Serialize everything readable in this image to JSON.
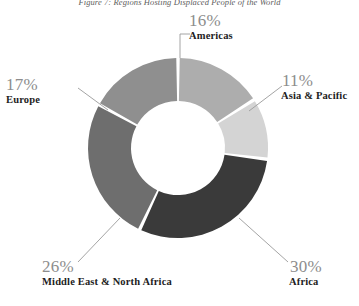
{
  "figure": {
    "title": "Figure 7: Regions Hosting Displaced People of the World"
  },
  "chart_data": {
    "type": "pie",
    "variant": "donut",
    "title": "Figure 7: Regions Hosting Displaced People of the World",
    "value_unit": "percent",
    "value_total": 100,
    "legend": "none (direct labels with leader lines)",
    "grid": false,
    "center": {
      "x": 178,
      "y": 148
    },
    "outer_radius": 90,
    "inner_radius": 43,
    "gap_degrees": 2.2,
    "start_angle_degrees": 0,
    "direction": "clockwise",
    "categories": [
      "Americas",
      "Asia & Pacific",
      "Africa",
      "Middle East & North Africa",
      "Europe"
    ],
    "values": [
      16,
      11,
      30,
      26,
      17
    ],
    "slices": [
      {
        "label": "Americas",
        "value": 16,
        "display_value": "16%",
        "color": "#adadad",
        "start_angle": 0,
        "end_angle": 57.6,
        "label_side": "top"
      },
      {
        "label": "Asia & Pacific",
        "value": 11,
        "display_value": "11%",
        "color": "#d4d4d4",
        "start_angle": 57.6,
        "end_angle": 97.2,
        "label_side": "right"
      },
      {
        "label": "Africa",
        "value": 30,
        "display_value": "30%",
        "color": "#3a3a3a",
        "start_angle": 97.2,
        "end_angle": 205.2,
        "label_side": "bottom-right"
      },
      {
        "label": "Middle East & North Africa",
        "value": 26,
        "display_value": "26%",
        "color": "#6e6e6e",
        "start_angle": 205.2,
        "end_angle": 298.8,
        "label_side": "bottom-left"
      },
      {
        "label": "Europe",
        "value": 17,
        "display_value": "17%",
        "color": "#8f8f8f",
        "start_angle": 298.8,
        "end_angle": 360,
        "label_side": "left"
      }
    ]
  },
  "callouts": {
    "americas": {
      "pct": "16%",
      "cat": "Americas"
    },
    "asia": {
      "pct": "11%",
      "cat": "Asia & Pacific"
    },
    "africa": {
      "pct": "30%",
      "cat": "Africa"
    },
    "mena": {
      "pct": "26%",
      "cat": "Middle East & North Africa"
    },
    "europe": {
      "pct": "17%",
      "cat": "Europe"
    }
  },
  "style": {
    "background": "#ffffff",
    "leader_line_color": "#9a9a9a",
    "percent_text_color": "#8d8d8d",
    "category_text_color": "#1d1d1d",
    "title_text_color": "#5d5d5d"
  }
}
